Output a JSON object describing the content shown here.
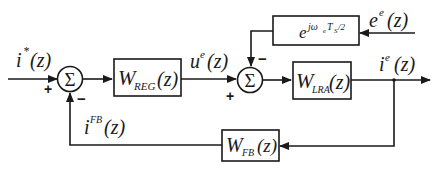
{
  "diagram": {
    "type": "block-diagram",
    "inputs": {
      "reference": {
        "base": "i",
        "sup": "*",
        "arg": "(z)"
      },
      "disturbance": {
        "base": "e",
        "sup": "e",
        "arg": "(z)"
      }
    },
    "outputs": {
      "current": {
        "base": "i",
        "sup": "e",
        "arg": "(z)"
      }
    },
    "signals": {
      "control": {
        "base": "u",
        "sup": "e",
        "arg": "(z)"
      },
      "feedback": {
        "base": "i",
        "sup": "FB",
        "arg": "(z)"
      }
    },
    "summing_junctions": [
      {
        "id": "sum1",
        "symbol": "Σ",
        "signs": {
          "left": "+",
          "bottom": "−"
        }
      },
      {
        "id": "sum2",
        "symbol": "Σ",
        "signs": {
          "bottom": "+",
          "top": "−"
        }
      }
    ],
    "blocks": [
      {
        "id": "regulator",
        "base": "W",
        "sub": "REG",
        "arg": "(z)"
      },
      {
        "id": "plant",
        "base": "W",
        "sub": "LRA",
        "arg": "(z)"
      },
      {
        "id": "feedback",
        "base": "W",
        "sub": "FB",
        "arg": "(z)"
      },
      {
        "id": "delay",
        "base": "e",
        "sup": "jω",
        "sup_sub": "e",
        "sup_rest": "T",
        "sup_sub2": "S",
        "sup_tail": "/2"
      }
    ]
  }
}
